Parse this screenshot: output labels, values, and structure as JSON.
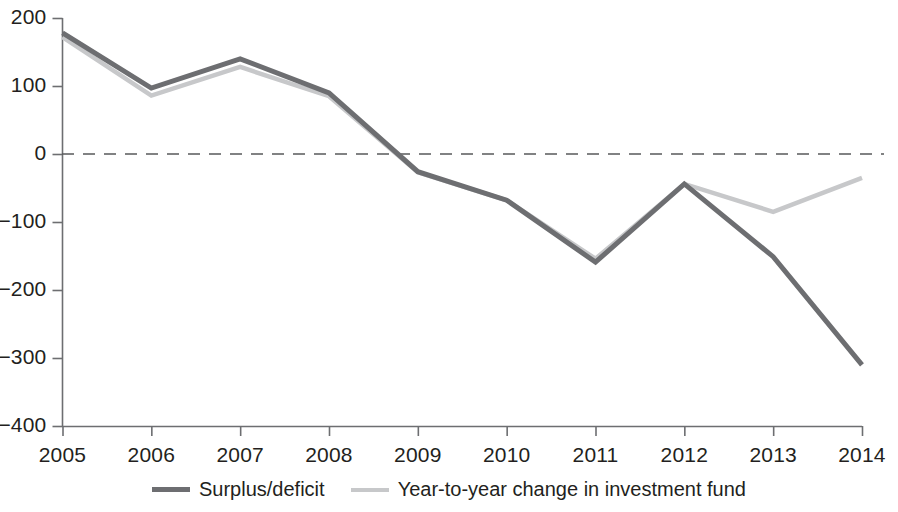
{
  "chart_data": {
    "type": "line",
    "title": "",
    "subtitle": "",
    "xlabel": "",
    "ylabel": "",
    "x": [
      2005,
      2006,
      2007,
      2008,
      2009,
      2010,
      2011,
      2012,
      2013,
      2014
    ],
    "categories": [
      "2005",
      "2006",
      "2007",
      "2008",
      "2009",
      "2010",
      "2011",
      "2012",
      "2013",
      "2014"
    ],
    "series": [
      {
        "name": "Surplus/deficit",
        "color": "#6d6e71",
        "values": [
          178,
          97,
          140,
          90,
          -26,
          -68,
          -159,
          -44,
          -151,
          -310
        ]
      },
      {
        "name": "Year-to-year change in investment fund",
        "color": "#c7c8ca",
        "values": [
          172,
          86,
          128,
          85,
          -27,
          -68,
          -154,
          -44,
          -85,
          -35
        ]
      }
    ],
    "ylim": [
      -400,
      200
    ],
    "xlim": [
      2005,
      2014
    ],
    "yticks": [
      200,
      100,
      0,
      -100,
      -200,
      -300,
      -400
    ],
    "ytick_labels": [
      "200",
      "100",
      "0",
      "−100",
      "−200",
      "−300",
      "−400"
    ],
    "xticks": [
      2005,
      2006,
      2007,
      2008,
      2009,
      2010,
      2011,
      2012,
      2013,
      2014
    ],
    "xtick_labels": [
      "2005",
      "2006",
      "2007",
      "2008",
      "2009",
      "2010",
      "2011",
      "2012",
      "2013",
      "2014"
    ],
    "grid": false,
    "zero_line": {
      "value": 0,
      "style": "dashed",
      "color": "#58595b"
    },
    "legend": {
      "position": "bottom-center",
      "entries": [
        {
          "label": "Surplus/deficit",
          "color": "#6d6e71"
        },
        {
          "label": "Year-to-year change in investment fund",
          "color": "#c7c8ca"
        }
      ]
    },
    "axis_color": "#6d6e71"
  }
}
